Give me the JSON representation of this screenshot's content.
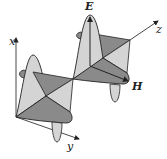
{
  "diagram": {
    "axes": {
      "x_label": "x",
      "y_label": "y",
      "z_label": "z"
    },
    "vectors": {
      "electric_label": "E",
      "magnetic_label": "H"
    },
    "colors": {
      "light_fill": "#d4d4d4",
      "dark_fill": "#8a8a8a",
      "stroke": "#222222",
      "axis": "#333333"
    }
  }
}
